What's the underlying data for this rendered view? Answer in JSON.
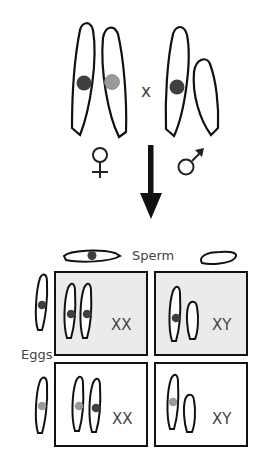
{
  "parents": {
    "cross_symbol": "x",
    "female_symbol": "♀",
    "male_symbol": "♂"
  },
  "punnett": {
    "sperm_label": "Sperm",
    "eggs_label": "Eggs",
    "cells": [
      {
        "genotype": "XX",
        "shaded": true
      },
      {
        "genotype": "XY",
        "shaded": true
      },
      {
        "genotype": "XX",
        "shaded": false
      },
      {
        "genotype": "XY",
        "shaded": false
      }
    ]
  },
  "colors": {
    "dark_allele": "#3f3f3f",
    "light_allele": "#9a9a9a",
    "shaded_cell": "#ebebeb",
    "outline": "#111111"
  }
}
